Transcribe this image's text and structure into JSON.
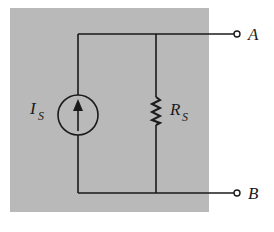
{
  "diagram": {
    "type": "circuit",
    "colors": {
      "background_box": "#b9b9b9",
      "wire": "#1a1a1a",
      "page": "#ffffff"
    },
    "components": {
      "current_source": {
        "symbol": "I",
        "subscript": "S",
        "direction": "up"
      },
      "resistor": {
        "symbol": "R",
        "subscript": "S"
      }
    },
    "terminals": {
      "top": {
        "label": "A"
      },
      "bottom": {
        "label": "B"
      }
    }
  }
}
